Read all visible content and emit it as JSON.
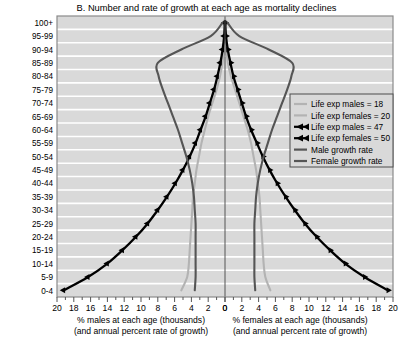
{
  "chart_data": {
    "type": "line",
    "title": "B. Number and rate of growth at each age as mortality declines",
    "xlabel_left_line1": "% males at each age (thousands)",
    "xlabel_left_line2": "(and annual percent rate of growth)",
    "xlabel_right_line1": "% females at each age (thousands)",
    "xlabel_right_line2": "(and annual percent rate of growth)",
    "ylabel": "",
    "grid": true,
    "legend_position": "right-upper",
    "xlim_left": [
      20,
      0
    ],
    "xlim_right": [
      0,
      20
    ],
    "xticks_left": [
      "20",
      "18",
      "16",
      "14",
      "12",
      "10",
      "8",
      "6",
      "4",
      "2",
      "0"
    ],
    "xticks_right": [
      "0",
      "2",
      "4",
      "6",
      "8",
      "10",
      "12",
      "14",
      "16",
      "18",
      "20"
    ],
    "xtick_values": [
      20,
      18,
      16,
      14,
      12,
      10,
      8,
      6,
      4,
      2,
      0
    ],
    "minor_tick_step": 1,
    "categories": [
      "0-4",
      "5-9",
      "10-14",
      "15-19",
      "20-24",
      "25-29",
      "30-34",
      "35-39",
      "40-44",
      "45-49",
      "50-54",
      "55-59",
      "60-64",
      "65-69",
      "70-74",
      "75-79",
      "80-84",
      "85-89",
      "90-94",
      "95-99",
      "100+"
    ],
    "series": [
      {
        "name": "Life exp males = 18",
        "side": "left",
        "color": "#b3b3b3",
        "marker": "none",
        "values": [
          5.2,
          4.5,
          4.3,
          4.2,
          4.1,
          4.0,
          3.9,
          3.8,
          3.6,
          3.4,
          3.1,
          2.8,
          2.4,
          2.0,
          1.5,
          1.0,
          0.6,
          0.3,
          0.12,
          0.04,
          0.01
        ]
      },
      {
        "name": "Life exp females = 20",
        "side": "right",
        "color": "#b3b3b3",
        "marker": "none",
        "values": [
          5.4,
          4.8,
          4.6,
          4.5,
          4.4,
          4.3,
          4.2,
          4.1,
          3.9,
          3.7,
          3.4,
          3.1,
          2.7,
          2.2,
          1.7,
          1.2,
          0.7,
          0.35,
          0.15,
          0.05,
          0.01
        ]
      },
      {
        "name": "Life exp males = 47",
        "side": "left",
        "color": "#000000",
        "marker": "triangle-left",
        "values": [
          19.2,
          16.3,
          14.0,
          12.2,
          10.6,
          9.2,
          8.0,
          6.9,
          5.9,
          5.0,
          4.2,
          3.5,
          2.9,
          2.3,
          1.8,
          1.3,
          0.9,
          0.55,
          0.28,
          0.1,
          0.02
        ]
      },
      {
        "name": "Life exp females = 50",
        "side": "right",
        "color": "#000000",
        "marker": "triangle-right",
        "values": [
          19.4,
          16.6,
          14.3,
          12.5,
          10.9,
          9.5,
          8.3,
          7.2,
          6.2,
          5.3,
          4.5,
          3.8,
          3.1,
          2.5,
          2.0,
          1.5,
          1.0,
          0.65,
          0.33,
          0.12,
          0.02
        ]
      },
      {
        "name": "Male growth rate",
        "side": "left",
        "color": "#555555",
        "marker": "none",
        "values": [
          3.6,
          3.5,
          3.5,
          3.5,
          3.5,
          3.5,
          3.6,
          3.7,
          3.9,
          4.2,
          4.6,
          5.1,
          5.6,
          6.2,
          6.8,
          7.4,
          7.9,
          8.0,
          5.2,
          1.7,
          0.3
        ]
      },
      {
        "name": "Female growth rate",
        "side": "right",
        "color": "#555555",
        "marker": "none",
        "values": [
          3.6,
          3.5,
          3.5,
          3.5,
          3.5,
          3.5,
          3.6,
          3.7,
          3.9,
          4.2,
          4.6,
          5.1,
          5.6,
          6.2,
          6.8,
          7.4,
          7.9,
          8.0,
          5.2,
          1.7,
          0.3
        ]
      }
    ],
    "legend": [
      {
        "label": "Life exp males = 18",
        "color": "#b3b3b3",
        "marker": "none"
      },
      {
        "label": "Life exp females = 20",
        "color": "#b3b3b3",
        "marker": "none"
      },
      {
        "label": "Life exp males = 47",
        "color": "#000000",
        "marker": "triangle"
      },
      {
        "label": "Life exp females = 50",
        "color": "#000000",
        "marker": "triangle"
      },
      {
        "label": "Male growth rate",
        "color": "#555555",
        "marker": "none"
      },
      {
        "label": "Female growth rate",
        "color": "#555555",
        "marker": "none"
      }
    ],
    "colors": {
      "plot_background": "#d9d9d9",
      "gridline": "#ffffff",
      "axis": "#555555",
      "center_line": "#555555",
      "light_series": "#b3b3b3",
      "dark_series": "#555555",
      "black_series": "#000000"
    }
  }
}
